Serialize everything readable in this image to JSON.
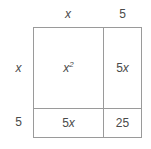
{
  "diagram": {
    "kind": "area-model",
    "colors": {
      "background": "#ffffff",
      "border": "#9a9a9a",
      "text": "#4a4a4a"
    },
    "column_labels": [
      {
        "text": "x",
        "style": "italic"
      },
      {
        "text": "5",
        "style": "normal"
      }
    ],
    "row_labels": [
      {
        "text": "x",
        "style": "italic"
      },
      {
        "text": "5",
        "style": "normal"
      }
    ],
    "cells": [
      [
        {
          "coefficient": "",
          "variable": "x",
          "exponent": "2",
          "plain": "x2"
        },
        {
          "coefficient": "5",
          "variable": "x",
          "exponent": "",
          "plain": "5x"
        }
      ],
      [
        {
          "coefficient": "5",
          "variable": "x",
          "exponent": "",
          "plain": "5x"
        },
        {
          "coefficient": "25",
          "variable": "",
          "exponent": "",
          "plain": "25"
        }
      ]
    ]
  }
}
